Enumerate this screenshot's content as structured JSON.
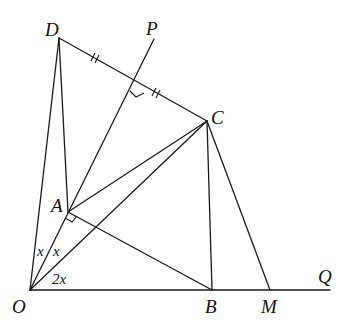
{
  "diagram": {
    "points": {
      "O": {
        "label": "O"
      },
      "A": {
        "label": "A"
      },
      "B": {
        "label": "B"
      },
      "C": {
        "label": "C"
      },
      "D": {
        "label": "D"
      },
      "M": {
        "label": "M"
      },
      "P": {
        "label": "P"
      },
      "Q": {
        "label": "Q"
      }
    },
    "angles": {
      "DOA": "x",
      "AOC": "x",
      "COB": "2x"
    },
    "segments": [
      "OD",
      "OP",
      "OC",
      "OQ",
      "DC",
      "DA",
      "AC",
      "AB",
      "CB",
      "CM"
    ],
    "marks": {
      "equal_ticks": "DC bisected by OP (double ticks on each half)",
      "right_angles": [
        "OP ⟂ DC",
        "AB ⟂ OP at A"
      ]
    }
  }
}
